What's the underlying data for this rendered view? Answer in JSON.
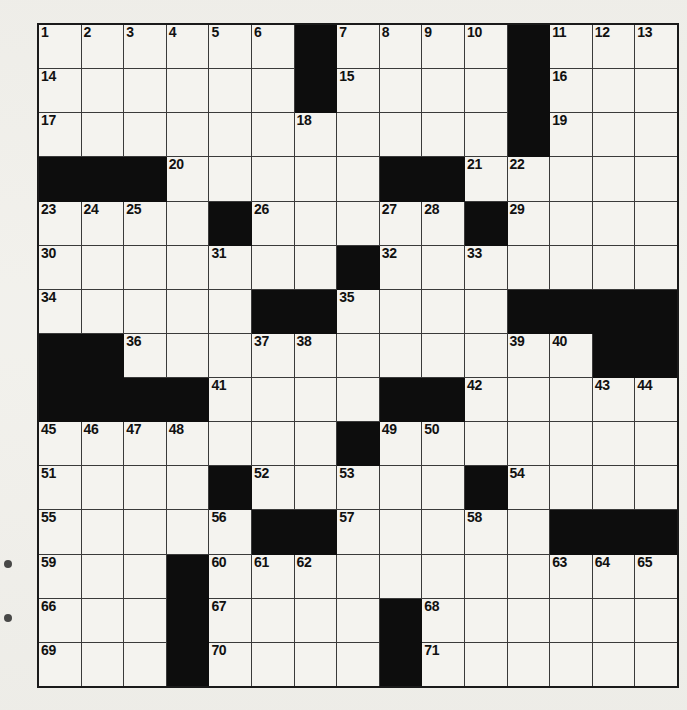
{
  "page": {
    "background_color": "#f2f1ec",
    "edge_marks": [
      "margin-dot",
      "margin-dot"
    ]
  },
  "grid": {
    "rows": 15,
    "cols": 15,
    "cell_color": "#f4f3ef",
    "block_color": "#0d0d0d",
    "border_color": "#3a3a3a",
    "outer_border_color": "#1a1a1a",
    "total_clue_numbers": 71,
    "cells": [
      [
        {
          "type": "open",
          "num": "1"
        },
        {
          "type": "open",
          "num": "2"
        },
        {
          "type": "open",
          "num": "3"
        },
        {
          "type": "open",
          "num": "4"
        },
        {
          "type": "open",
          "num": "5"
        },
        {
          "type": "open",
          "num": "6"
        },
        {
          "type": "block",
          "num": ""
        },
        {
          "type": "open",
          "num": "7"
        },
        {
          "type": "open",
          "num": "8"
        },
        {
          "type": "open",
          "num": "9"
        },
        {
          "type": "open",
          "num": "10"
        },
        {
          "type": "block",
          "num": ""
        },
        {
          "type": "open",
          "num": "11"
        },
        {
          "type": "open",
          "num": "12"
        },
        {
          "type": "open",
          "num": "13"
        }
      ],
      [
        {
          "type": "open",
          "num": "14"
        },
        {
          "type": "open",
          "num": ""
        },
        {
          "type": "open",
          "num": ""
        },
        {
          "type": "open",
          "num": ""
        },
        {
          "type": "open",
          "num": ""
        },
        {
          "type": "open",
          "num": ""
        },
        {
          "type": "block",
          "num": ""
        },
        {
          "type": "open",
          "num": "15"
        },
        {
          "type": "open",
          "num": ""
        },
        {
          "type": "open",
          "num": ""
        },
        {
          "type": "open",
          "num": ""
        },
        {
          "type": "block",
          "num": ""
        },
        {
          "type": "open",
          "num": "16"
        },
        {
          "type": "open",
          "num": ""
        },
        {
          "type": "open",
          "num": ""
        }
      ],
      [
        {
          "type": "open",
          "num": "17"
        },
        {
          "type": "open",
          "num": ""
        },
        {
          "type": "open",
          "num": ""
        },
        {
          "type": "open",
          "num": ""
        },
        {
          "type": "open",
          "num": ""
        },
        {
          "type": "open",
          "num": ""
        },
        {
          "type": "open",
          "num": "18"
        },
        {
          "type": "open",
          "num": ""
        },
        {
          "type": "open",
          "num": ""
        },
        {
          "type": "open",
          "num": ""
        },
        {
          "type": "open",
          "num": ""
        },
        {
          "type": "block",
          "num": ""
        },
        {
          "type": "open",
          "num": "19"
        },
        {
          "type": "open",
          "num": ""
        },
        {
          "type": "open",
          "num": ""
        }
      ],
      [
        {
          "type": "block",
          "num": ""
        },
        {
          "type": "block",
          "num": ""
        },
        {
          "type": "block",
          "num": ""
        },
        {
          "type": "open",
          "num": "20"
        },
        {
          "type": "open",
          "num": ""
        },
        {
          "type": "open",
          "num": ""
        },
        {
          "type": "open",
          "num": ""
        },
        {
          "type": "open",
          "num": ""
        },
        {
          "type": "block",
          "num": ""
        },
        {
          "type": "block",
          "num": ""
        },
        {
          "type": "open",
          "num": "21"
        },
        {
          "type": "open",
          "num": "22"
        },
        {
          "type": "open",
          "num": ""
        },
        {
          "type": "open",
          "num": ""
        },
        {
          "type": "open",
          "num": ""
        }
      ],
      [
        {
          "type": "open",
          "num": "23"
        },
        {
          "type": "open",
          "num": "24"
        },
        {
          "type": "open",
          "num": "25"
        },
        {
          "type": "open",
          "num": ""
        },
        {
          "type": "block",
          "num": ""
        },
        {
          "type": "open",
          "num": "26"
        },
        {
          "type": "open",
          "num": ""
        },
        {
          "type": "open",
          "num": ""
        },
        {
          "type": "open",
          "num": "27"
        },
        {
          "type": "open",
          "num": "28"
        },
        {
          "type": "block",
          "num": ""
        },
        {
          "type": "open",
          "num": "29"
        },
        {
          "type": "open",
          "num": ""
        },
        {
          "type": "open",
          "num": ""
        },
        {
          "type": "open",
          "num": ""
        }
      ],
      [
        {
          "type": "open",
          "num": "30"
        },
        {
          "type": "open",
          "num": ""
        },
        {
          "type": "open",
          "num": ""
        },
        {
          "type": "open",
          "num": ""
        },
        {
          "type": "open",
          "num": "31"
        },
        {
          "type": "open",
          "num": ""
        },
        {
          "type": "open",
          "num": ""
        },
        {
          "type": "block",
          "num": ""
        },
        {
          "type": "open",
          "num": "32"
        },
        {
          "type": "open",
          "num": ""
        },
        {
          "type": "open",
          "num": "33"
        },
        {
          "type": "open",
          "num": ""
        },
        {
          "type": "open",
          "num": ""
        },
        {
          "type": "open",
          "num": ""
        },
        {
          "type": "open",
          "num": ""
        }
      ],
      [
        {
          "type": "open",
          "num": "34"
        },
        {
          "type": "open",
          "num": ""
        },
        {
          "type": "open",
          "num": ""
        },
        {
          "type": "open",
          "num": ""
        },
        {
          "type": "open",
          "num": ""
        },
        {
          "type": "block",
          "num": ""
        },
        {
          "type": "block",
          "num": ""
        },
        {
          "type": "open",
          "num": "35"
        },
        {
          "type": "open",
          "num": ""
        },
        {
          "type": "open",
          "num": ""
        },
        {
          "type": "open",
          "num": ""
        },
        {
          "type": "block",
          "num": ""
        },
        {
          "type": "block",
          "num": ""
        },
        {
          "type": "block",
          "num": ""
        },
        {
          "type": "block",
          "num": ""
        }
      ],
      [
        {
          "type": "block",
          "num": ""
        },
        {
          "type": "block",
          "num": ""
        },
        {
          "type": "open",
          "num": "36"
        },
        {
          "type": "open",
          "num": ""
        },
        {
          "type": "open",
          "num": ""
        },
        {
          "type": "open",
          "num": "37"
        },
        {
          "type": "open",
          "num": "38"
        },
        {
          "type": "open",
          "num": ""
        },
        {
          "type": "open",
          "num": ""
        },
        {
          "type": "open",
          "num": ""
        },
        {
          "type": "open",
          "num": ""
        },
        {
          "type": "open",
          "num": "39"
        },
        {
          "type": "open",
          "num": "40"
        },
        {
          "type": "block",
          "num": ""
        },
        {
          "type": "block",
          "num": ""
        }
      ],
      [
        {
          "type": "block",
          "num": ""
        },
        {
          "type": "block",
          "num": ""
        },
        {
          "type": "block",
          "num": ""
        },
        {
          "type": "block",
          "num": ""
        },
        {
          "type": "open",
          "num": "41"
        },
        {
          "type": "open",
          "num": ""
        },
        {
          "type": "open",
          "num": ""
        },
        {
          "type": "open",
          "num": ""
        },
        {
          "type": "block",
          "num": ""
        },
        {
          "type": "block",
          "num": ""
        },
        {
          "type": "open",
          "num": "42"
        },
        {
          "type": "open",
          "num": ""
        },
        {
          "type": "open",
          "num": ""
        },
        {
          "type": "open",
          "num": "43"
        },
        {
          "type": "open",
          "num": "44"
        }
      ],
      [
        {
          "type": "open",
          "num": "45"
        },
        {
          "type": "open",
          "num": "46"
        },
        {
          "type": "open",
          "num": "47"
        },
        {
          "type": "open",
          "num": "48"
        },
        {
          "type": "open",
          "num": ""
        },
        {
          "type": "open",
          "num": ""
        },
        {
          "type": "open",
          "num": ""
        },
        {
          "type": "block",
          "num": ""
        },
        {
          "type": "open",
          "num": "49"
        },
        {
          "type": "open",
          "num": "50"
        },
        {
          "type": "open",
          "num": ""
        },
        {
          "type": "open",
          "num": ""
        },
        {
          "type": "open",
          "num": ""
        },
        {
          "type": "open",
          "num": ""
        },
        {
          "type": "open",
          "num": ""
        }
      ],
      [
        {
          "type": "open",
          "num": "51"
        },
        {
          "type": "open",
          "num": ""
        },
        {
          "type": "open",
          "num": ""
        },
        {
          "type": "open",
          "num": ""
        },
        {
          "type": "block",
          "num": ""
        },
        {
          "type": "open",
          "num": "52"
        },
        {
          "type": "open",
          "num": ""
        },
        {
          "type": "open",
          "num": "53"
        },
        {
          "type": "open",
          "num": ""
        },
        {
          "type": "open",
          "num": ""
        },
        {
          "type": "block",
          "num": ""
        },
        {
          "type": "open",
          "num": "54"
        },
        {
          "type": "open",
          "num": ""
        },
        {
          "type": "open",
          "num": ""
        },
        {
          "type": "open",
          "num": ""
        }
      ],
      [
        {
          "type": "open",
          "num": "55"
        },
        {
          "type": "open",
          "num": ""
        },
        {
          "type": "open",
          "num": ""
        },
        {
          "type": "open",
          "num": ""
        },
        {
          "type": "open",
          "num": "56"
        },
        {
          "type": "block",
          "num": ""
        },
        {
          "type": "block",
          "num": ""
        },
        {
          "type": "open",
          "num": "57"
        },
        {
          "type": "open",
          "num": ""
        },
        {
          "type": "open",
          "num": ""
        },
        {
          "type": "open",
          "num": "58"
        },
        {
          "type": "open",
          "num": ""
        },
        {
          "type": "block",
          "num": ""
        },
        {
          "type": "block",
          "num": ""
        },
        {
          "type": "block",
          "num": ""
        }
      ],
      [
        {
          "type": "open",
          "num": "59"
        },
        {
          "type": "open",
          "num": ""
        },
        {
          "type": "open",
          "num": ""
        },
        {
          "type": "block",
          "num": ""
        },
        {
          "type": "open",
          "num": "60"
        },
        {
          "type": "open",
          "num": "61"
        },
        {
          "type": "open",
          "num": "62"
        },
        {
          "type": "open",
          "num": ""
        },
        {
          "type": "open",
          "num": ""
        },
        {
          "type": "open",
          "num": ""
        },
        {
          "type": "open",
          "num": ""
        },
        {
          "type": "open",
          "num": ""
        },
        {
          "type": "open",
          "num": "63"
        },
        {
          "type": "open",
          "num": "64"
        },
        {
          "type": "open",
          "num": "65"
        }
      ],
      [
        {
          "type": "open",
          "num": "66"
        },
        {
          "type": "open",
          "num": ""
        },
        {
          "type": "open",
          "num": ""
        },
        {
          "type": "block",
          "num": ""
        },
        {
          "type": "open",
          "num": "67"
        },
        {
          "type": "open",
          "num": ""
        },
        {
          "type": "open",
          "num": ""
        },
        {
          "type": "open",
          "num": ""
        },
        {
          "type": "block",
          "num": ""
        },
        {
          "type": "open",
          "num": "68"
        },
        {
          "type": "open",
          "num": ""
        },
        {
          "type": "open",
          "num": ""
        },
        {
          "type": "open",
          "num": ""
        },
        {
          "type": "open",
          "num": ""
        },
        {
          "type": "open",
          "num": ""
        }
      ],
      [
        {
          "type": "open",
          "num": "69"
        },
        {
          "type": "open",
          "num": ""
        },
        {
          "type": "open",
          "num": ""
        },
        {
          "type": "block",
          "num": ""
        },
        {
          "type": "open",
          "num": "70"
        },
        {
          "type": "open",
          "num": ""
        },
        {
          "type": "open",
          "num": ""
        },
        {
          "type": "open",
          "num": ""
        },
        {
          "type": "block",
          "num": ""
        },
        {
          "type": "open",
          "num": "71"
        },
        {
          "type": "open",
          "num": ""
        },
        {
          "type": "open",
          "num": ""
        },
        {
          "type": "open",
          "num": ""
        },
        {
          "type": "open",
          "num": ""
        },
        {
          "type": "open",
          "num": ""
        }
      ]
    ]
  }
}
